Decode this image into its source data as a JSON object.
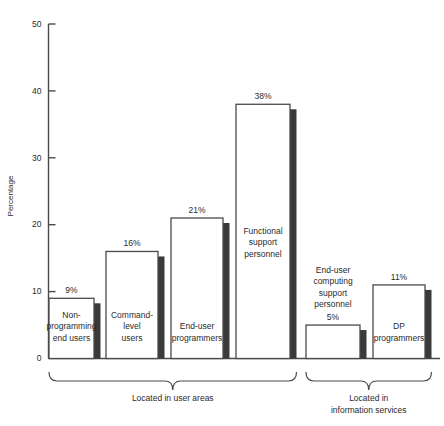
{
  "chart_data": {
    "type": "bar",
    "title": "",
    "xlabel": "",
    "ylabel": "Percentage",
    "ylim": [
      0,
      50
    ],
    "ytick_values": [
      0,
      10,
      20,
      30,
      40,
      50
    ],
    "ytick_labels": [
      "0",
      "10",
      "20",
      "30",
      "40",
      "50"
    ],
    "grid": false,
    "legend": "none",
    "categories": [
      "Non-programming end users",
      "Command-level users",
      "End-user programmers",
      "Functional support personnel",
      "End-user computing support personnel",
      "DP programmers"
    ],
    "values": [
      9,
      16,
      21,
      38,
      5,
      11
    ],
    "value_labels": [
      "9%",
      "16%",
      "21%",
      "38%",
      "5%",
      "11%"
    ],
    "bars": [
      {
        "label_lines": [
          "Non-",
          "programming",
          "end users"
        ],
        "value": 9,
        "value_label": "9%",
        "group": "Located in user areas"
      },
      {
        "label_lines": [
          "Command-",
          "level",
          "users"
        ],
        "value": 16,
        "value_label": "16%",
        "group": "Located in user areas"
      },
      {
        "label_lines": [
          "End-user",
          "programmers"
        ],
        "value": 21,
        "value_label": "21%",
        "group": "Located in user areas"
      },
      {
        "label_lines": [
          "Functional",
          "support",
          "personnel"
        ],
        "value": 38,
        "value_label": "38%",
        "group": "Located in user areas"
      },
      {
        "label_lines": [
          "End-user",
          "computing",
          "support",
          "personnel"
        ],
        "value": 5,
        "value_label": "5%",
        "group": "Located in information services"
      },
      {
        "label_lines": [
          "DP",
          "programmers"
        ],
        "value": 11,
        "value_label": "11%",
        "group": "Located in information services"
      }
    ],
    "groups": [
      {
        "label_lines": [
          "Located in user areas"
        ],
        "bar_start": 0,
        "bar_end": 3
      },
      {
        "label_lines": [
          "Located in",
          "information services"
        ],
        "bar_start": 4,
        "bar_end": 5
      }
    ],
    "colors": {
      "bar_fill": "#ffffff",
      "bar_stroke": "#4a4a4a",
      "bar_shadow": "#3a3a3a",
      "axis": "#4a4a4a",
      "text": "#2b2b2b",
      "background": "#ffffff"
    }
  }
}
